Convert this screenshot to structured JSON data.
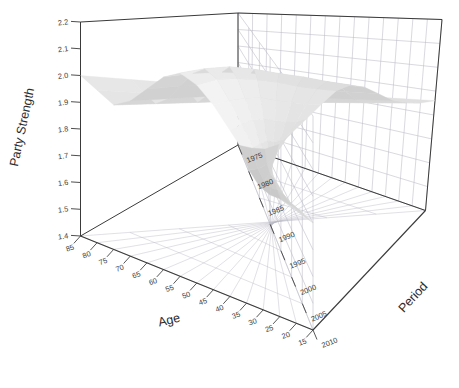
{
  "figure": {
    "type": "surface-3d",
    "background_color": "#ffffff",
    "box_edge_color": "#3a3a3a",
    "grid_color": "#b9b9c4"
  },
  "axes": {
    "z": {
      "title": "Party Strength",
      "ticks": [
        "2.2",
        "2.1",
        "2.0",
        "1.9",
        "1.8",
        "1.7",
        "1.6",
        "1.5",
        "1.4"
      ],
      "min": 1.4,
      "max": 2.2,
      "step": 0.1
    },
    "x": {
      "title": "Age",
      "ticks": [
        "85",
        "80",
        "75",
        "70",
        "65",
        "60",
        "55",
        "50",
        "45",
        "40",
        "35",
        "30",
        "25",
        "20",
        "15"
      ],
      "min": 15,
      "max": 85,
      "step": 5
    },
    "y": {
      "title": "Period",
      "ticks": [
        "1975",
        "1980",
        "1985",
        "1990",
        "1995",
        "2000",
        "2005",
        "2010"
      ],
      "min": 1975,
      "max": 2010,
      "step": 5
    }
  },
  "chart_data": {
    "type": "surface",
    "title": "",
    "xlabel": "Age",
    "ylabel": "Period",
    "zlabel": "Party Strength",
    "xlim": [
      15,
      85
    ],
    "ylim": [
      1975,
      2010
    ],
    "zlim": [
      1.4,
      2.2
    ],
    "grid": true,
    "legend": null,
    "colormap": "grayscale",
    "x": [
      85,
      80,
      75,
      70,
      65,
      60,
      55,
      50,
      45,
      40,
      35,
      30,
      25,
      20,
      15
    ],
    "y": [
      1975,
      1980,
      1985,
      1990,
      1995,
      2000,
      2005,
      2010
    ],
    "z": [
      [
        2.0,
        1.97,
        1.94,
        1.98,
        2.05,
        2.12,
        2.16,
        2.14,
        2.09,
        2.02,
        1.95,
        1.88,
        1.84,
        1.82,
        1.8
      ],
      [
        1.98,
        1.95,
        1.93,
        1.97,
        2.04,
        2.11,
        2.15,
        2.13,
        2.07,
        2.0,
        1.93,
        1.86,
        1.81,
        1.78,
        1.76
      ],
      [
        1.96,
        1.94,
        1.92,
        1.96,
        2.02,
        2.09,
        2.13,
        2.1,
        2.04,
        1.97,
        1.89,
        1.82,
        1.77,
        1.73,
        1.7
      ],
      [
        1.94,
        1.92,
        1.91,
        1.94,
        2.0,
        2.06,
        2.09,
        2.06,
        2.0,
        1.92,
        1.84,
        1.76,
        1.7,
        1.66,
        1.63
      ],
      [
        1.92,
        1.9,
        1.89,
        1.92,
        1.97,
        2.02,
        2.04,
        2.01,
        1.94,
        1.86,
        1.77,
        1.69,
        1.62,
        1.57,
        1.54
      ],
      [
        1.9,
        1.88,
        1.87,
        1.89,
        1.93,
        1.97,
        1.99,
        1.95,
        1.88,
        1.79,
        1.7,
        1.61,
        1.54,
        1.49,
        1.46
      ],
      [
        1.88,
        1.86,
        1.85,
        1.86,
        1.89,
        1.92,
        1.93,
        1.89,
        1.81,
        1.72,
        1.63,
        1.54,
        1.47,
        1.43,
        1.41
      ],
      [
        1.86,
        1.84,
        1.83,
        1.83,
        1.85,
        1.87,
        1.87,
        1.83,
        1.75,
        1.66,
        1.57,
        1.48,
        1.43,
        1.41,
        1.4
      ]
    ]
  }
}
